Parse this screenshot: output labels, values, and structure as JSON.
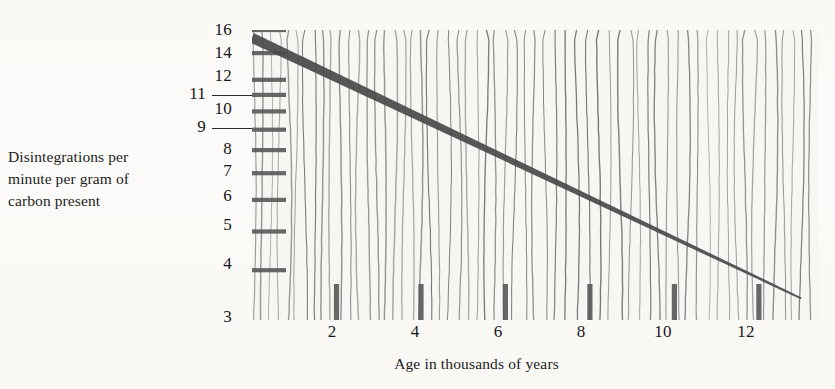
{
  "chart_data": {
    "type": "line",
    "title": "",
    "subtitle": "",
    "xlabel": "Age in thousands of years",
    "ylabel": "Disintegrations per minute per gram of carbon present",
    "ylabel_lines": [
      "Disintegrations per",
      "minute per gram of",
      "carbon present"
    ],
    "yscale": "log",
    "xscale": "linear",
    "ylim": [
      3,
      16
    ],
    "xlim": [
      0,
      13.4
    ],
    "ytick_labels": [
      "16",
      "14",
      "12",
      "11",
      "10",
      "9",
      "8",
      "7",
      "6",
      "5",
      "4",
      "3"
    ],
    "ytick_values": [
      16,
      14,
      12,
      11,
      10,
      9,
      8,
      7,
      6,
      5,
      4,
      3
    ],
    "ytick_with_leader": [
      11,
      9
    ],
    "xtick_labels": [
      "2",
      "4",
      "6",
      "8",
      "10",
      "12"
    ],
    "xtick_values": [
      2,
      4,
      6,
      8,
      10,
      12
    ],
    "grid": {
      "vertical": true,
      "horizontal": true,
      "horizontal_extent": "left-margin-only",
      "note": "dense wavy vertical rulings across full plot; bold short horizontal rules at each y tick near the axis"
    },
    "legend": {
      "present": false,
      "position": "none"
    },
    "series": [
      {
        "name": "Carbon-14 decay",
        "x": [
          0,
          1,
          2,
          3,
          4,
          5,
          6,
          7,
          8,
          9,
          10,
          11,
          12,
          13
        ],
        "y": [
          15.3,
          13.6,
          12.1,
          10.8,
          9.6,
          8.5,
          7.6,
          6.8,
          6.0,
          5.4,
          4.8,
          4.2,
          3.8,
          3.4
        ],
        "style": "solid",
        "linewidth": "thick",
        "color": "#4a4a4a",
        "note": "straight on semi-log axes; starts at upper-left near 15.3 dpm and falls to about 3.4 dpm at 13 thousand years"
      }
    ],
    "annotations": [],
    "colors": {
      "ink": "#2b2b2b",
      "grid": "#6e6e6e",
      "grid_bold": "#5a5a5a",
      "curve": "#4a4a4a",
      "paper": "#f7f6f3"
    }
  }
}
